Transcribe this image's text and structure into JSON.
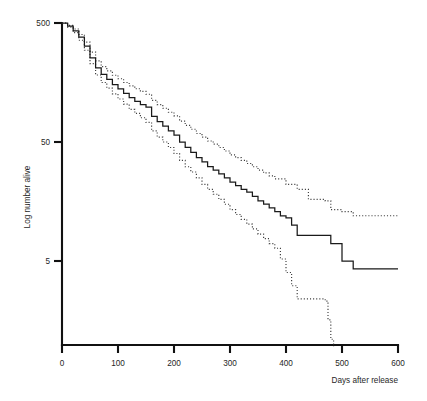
{
  "chart_data": {
    "type": "line",
    "title": "",
    "subtitle": "",
    "xlabel": "Days after release",
    "ylabel": "Log number alive",
    "xlim": [
      0,
      600
    ],
    "ylim": [
      0.9,
      500
    ],
    "yscale": "log",
    "grid": false,
    "legend_position": "none",
    "x_ticks": [
      0,
      100,
      200,
      300,
      400,
      500,
      600
    ],
    "x_tick_labels": [
      "0",
      "100",
      "200",
      "300",
      "400",
      "500",
      "600"
    ],
    "y_ticks": [
      500,
      50,
      5
    ],
    "y_tick_labels": [
      "500",
      "50",
      "5"
    ],
    "annotations": [],
    "series": [
      {
        "name": "Survival estimate",
        "style": "solid",
        "color": "#1a1a1a",
        "x": [
          0,
          10,
          20,
          30,
          40,
          50,
          60,
          70,
          80,
          90,
          100,
          110,
          120,
          130,
          140,
          150,
          160,
          170,
          180,
          190,
          200,
          210,
          220,
          230,
          240,
          250,
          260,
          270,
          280,
          290,
          300,
          310,
          320,
          330,
          340,
          350,
          360,
          370,
          380,
          390,
          400,
          410,
          420,
          440,
          460,
          470,
          480,
          500,
          510,
          520,
          540,
          560,
          580,
          600
        ],
        "values": [
          500,
          470,
          430,
          380,
          320,
          255,
          210,
          185,
          168,
          152,
          140,
          128,
          118,
          110,
          103,
          98,
          82,
          74,
          68,
          62,
          57,
          50,
          45,
          41,
          37,
          34,
          31,
          29,
          27,
          25,
          23,
          21.5,
          20,
          19,
          17.5,
          16,
          15,
          14,
          13,
          12,
          11.5,
          10,
          8.2,
          8.2,
          8.2,
          8.2,
          7.0,
          5.0,
          5.0,
          4.3,
          4.3,
          4.3,
          4.3,
          4.3
        ]
      },
      {
        "name": "Upper confidence limit",
        "style": "dotted",
        "color": "#3d3d3d",
        "x": [
          0,
          10,
          20,
          30,
          40,
          50,
          60,
          70,
          80,
          90,
          100,
          110,
          120,
          130,
          140,
          150,
          160,
          170,
          180,
          190,
          200,
          210,
          220,
          230,
          240,
          250,
          260,
          270,
          280,
          290,
          300,
          310,
          320,
          330,
          340,
          350,
          360,
          370,
          380,
          400,
          420,
          440,
          460,
          470,
          480,
          500,
          520,
          540,
          560,
          580,
          600
        ],
        "values": [
          500,
          478,
          445,
          400,
          345,
          285,
          240,
          215,
          198,
          182,
          170,
          158,
          148,
          140,
          133,
          126,
          112,
          103,
          96,
          89,
          83,
          75,
          69,
          64,
          59,
          55,
          51,
          48,
          45,
          42,
          39,
          37,
          35,
          33,
          31,
          29,
          27.5,
          26,
          24.5,
          22,
          20,
          16.5,
          16.5,
          16.0,
          13.5,
          13.0,
          12.0,
          12.0,
          12.0,
          12.0,
          12.0
        ]
      },
      {
        "name": "Lower confidence limit",
        "style": "dotted",
        "color": "#3d3d3d",
        "x": [
          0,
          10,
          20,
          30,
          40,
          50,
          60,
          70,
          80,
          90,
          100,
          110,
          120,
          130,
          140,
          150,
          160,
          170,
          180,
          190,
          200,
          210,
          220,
          230,
          240,
          250,
          260,
          270,
          280,
          290,
          300,
          310,
          320,
          330,
          340,
          350,
          360,
          370,
          380,
          390,
          400,
          410,
          420,
          440,
          460,
          470,
          475,
          480,
          485
        ],
        "values": [
          500,
          462,
          415,
          358,
          295,
          228,
          183,
          158,
          142,
          127,
          115,
          104,
          94,
          87,
          80,
          73,
          62,
          55,
          50,
          45,
          40,
          35,
          31,
          28,
          25,
          22,
          20,
          18.2,
          16.5,
          15,
          13.5,
          12.3,
          11.2,
          10.2,
          9.3,
          8.4,
          7.7,
          7.0,
          6.4,
          5.2,
          4.0,
          3.1,
          2.4,
          2.4,
          2.4,
          2.3,
          1.6,
          1.1,
          0.95
        ]
      }
    ]
  },
  "axes": {
    "x_axis_title": "Days after release",
    "y_axis_title": "Log number alive"
  }
}
